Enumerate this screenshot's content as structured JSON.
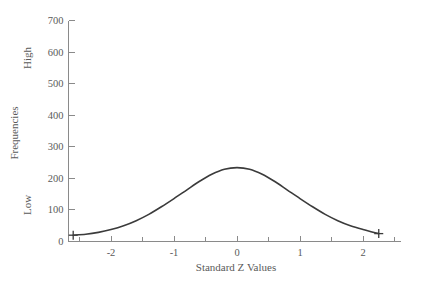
{
  "chart_data": {
    "type": "line",
    "title": "",
    "subtitle": "",
    "xlabel": "Standard Z  Values",
    "ylabel": "Frequencies",
    "ylabel_high": "High",
    "ylabel_low": "Low",
    "xlim": [
      -2.75,
      2.6
    ],
    "ylim": [
      0,
      700
    ],
    "grid": false,
    "legend": "none",
    "x_ticks": [
      -2,
      -1,
      0,
      1,
      2
    ],
    "x_tick_labels": [
      "-2",
      "-1",
      "0",
      "1",
      "2"
    ],
    "x_minor_ticks": [
      -2.5,
      -1.5,
      -0.5,
      0.5,
      1.5,
      2.5
    ],
    "y_ticks": [
      0,
      100,
      200,
      300,
      400,
      500,
      600,
      700
    ],
    "y_tick_labels": [
      "0",
      "100",
      "200",
      "300",
      "400",
      "500",
      "600",
      "700"
    ],
    "peak_value": 234,
    "peak_x": 0,
    "curve_color": "#3b3b3b",
    "axis_color": "#8a8a8a",
    "endpoint_markers": [
      {
        "x": -2.6,
        "y": 20
      },
      {
        "x": 2.25,
        "y": 25
      }
    ],
    "x": [
      -2.6,
      -2.4,
      -2.2,
      -2.0,
      -1.8,
      -1.6,
      -1.4,
      -1.2,
      -1.0,
      -0.8,
      -0.6,
      -0.4,
      -0.2,
      0.0,
      0.2,
      0.4,
      0.6,
      0.8,
      1.0,
      1.2,
      1.4,
      1.6,
      1.8,
      2.0,
      2.25
    ],
    "values": [
      20,
      23,
      29,
      38,
      50,
      66,
      86,
      110,
      136,
      163,
      190,
      213,
      229,
      234,
      229,
      213,
      190,
      163,
      136,
      110,
      86,
      66,
      50,
      38,
      25
    ]
  }
}
